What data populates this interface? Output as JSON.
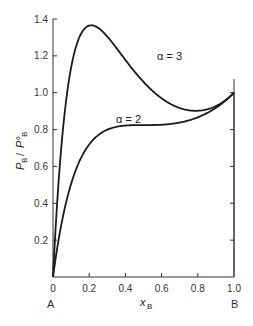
{
  "chart_data": {
    "type": "line",
    "title": "",
    "xlabel": "x_B",
    "ylabel": "P_B / P°_B",
    "xlim": [
      0,
      1.0
    ],
    "ylim": [
      0,
      1.4
    ],
    "x_ticks": [
      "0",
      "0.2",
      "0.4",
      "0.6",
      "0.8",
      "1.0"
    ],
    "y_ticks": [
      "0.2",
      "0.4",
      "0.6",
      "0.8",
      "1.0",
      "1.2",
      "1.4"
    ],
    "x_end_labels": {
      "left": "A",
      "right": "B"
    },
    "grid": false,
    "legend": "inline curve labels",
    "x": [
      0,
      0.05,
      0.1,
      0.15,
      0.2,
      0.25,
      0.3,
      0.35,
      0.4,
      0.45,
      0.5,
      0.55,
      0.6,
      0.65,
      0.7,
      0.75,
      0.8,
      0.85,
      0.9,
      0.95,
      1.0
    ],
    "series": [
      {
        "name": "α = 3",
        "label": "α = 3",
        "values": [
          0,
          0.75,
          1.14,
          1.32,
          1.36,
          1.35,
          1.29,
          1.24,
          1.17,
          1.11,
          1.06,
          1.01,
          0.97,
          0.94,
          0.92,
          0.91,
          0.9,
          0.91,
          0.93,
          0.96,
          1.0
        ]
      },
      {
        "name": "α = 2",
        "label": "α = 2",
        "values": [
          0,
          0.3,
          0.5,
          0.63,
          0.72,
          0.77,
          0.8,
          0.82,
          0.82,
          0.82,
          0.82,
          0.82,
          0.83,
          0.83,
          0.84,
          0.85,
          0.87,
          0.89,
          0.92,
          0.96,
          1.0
        ]
      }
    ]
  },
  "labels": {
    "y_axis": "P",
    "y_axis_sub": "B",
    "y_axis_over": "P°",
    "x_axis": "x",
    "x_axis_sub": "B",
    "end_left": "A",
    "end_right": "B",
    "origin": "0",
    "alpha3": "α = 3",
    "alpha2": "α = 2"
  },
  "colors": {
    "line": "#1a1a1a",
    "axis": "#333333",
    "background": "#ffffff"
  }
}
